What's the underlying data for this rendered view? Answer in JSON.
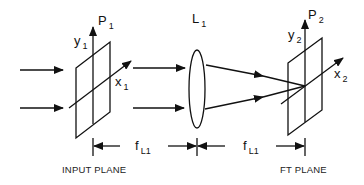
{
  "diagram": {
    "input_plane": {
      "name": "P",
      "name_sub": "1",
      "y_axis": "y",
      "y_sub": "1",
      "x_axis": "x",
      "x_sub": "1",
      "caption": "INPUT PLANE"
    },
    "lens": {
      "name": "L",
      "name_sub": "1"
    },
    "ft_plane": {
      "name": "P",
      "name_sub": "2",
      "y_axis": "y",
      "y_sub": "2",
      "x_axis": "x",
      "x_sub": "2",
      "caption": "FT PLANE"
    },
    "distances": [
      {
        "label": "f",
        "label_sub": "L1"
      },
      {
        "label": "f",
        "label_sub": "L1"
      }
    ],
    "colors": {
      "ink": "#111111",
      "background": "#ffffff"
    }
  }
}
